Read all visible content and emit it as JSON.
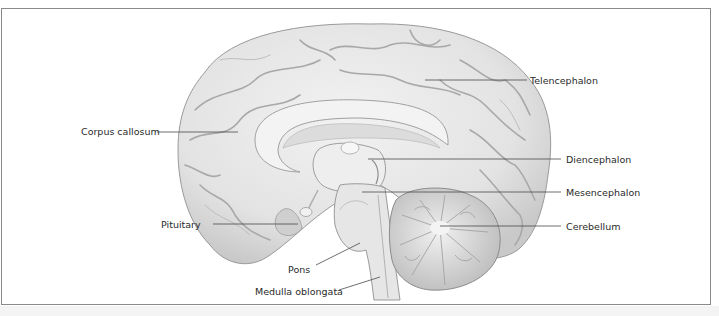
{
  "figure": {
    "labels": {
      "telencephalon": "Telencephalon",
      "corpus_callosum": "Corpus callosum",
      "diencephalon": "Diencephalon",
      "mesencephalon": "Mesencephalon",
      "pituitary": "Pituitary",
      "cerebellum": "Cerebellum",
      "pons": "Pons",
      "medulla_oblongata": "Medulla oblongata"
    },
    "colors": {
      "frame": "#8a8a8a",
      "brain_fill": "#e9e9e9",
      "gyri_shadow": "#9c9c9c",
      "leader_line": "#4a4a4a",
      "text": "#2a2a2a"
    }
  }
}
